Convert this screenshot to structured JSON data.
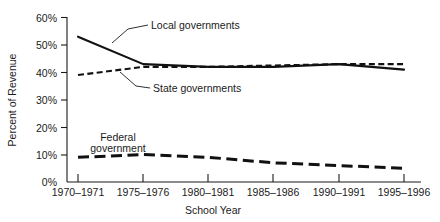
{
  "chart_data": {
    "type": "line",
    "title": "",
    "xlabel": "School Year",
    "ylabel": "Percent of Revenue",
    "categories": [
      "1970–1971",
      "1975–1976",
      "1980–1981",
      "1985–1986",
      "1990–1991",
      "1995–1996"
    ],
    "x": [
      1970,
      1975,
      1980,
      1985,
      1990,
      1995
    ],
    "ylim": [
      0,
      60
    ],
    "xlim": [
      1970,
      1995
    ],
    "ytick_labels": [
      "0%",
      "10%",
      "20%",
      "30%",
      "40%",
      "50%",
      "60%"
    ],
    "ytick_values": [
      0,
      10,
      20,
      30,
      40,
      50,
      60
    ],
    "grid": false,
    "legend_position": "inline-annotations",
    "series": [
      {
        "name": "Local governments",
        "style": "solid",
        "color": "#111111",
        "values": [
          53,
          43,
          42,
          42,
          43,
          41
        ]
      },
      {
        "name": "State governments",
        "style": "short-dashed",
        "color": "#111111",
        "values": [
          39,
          42,
          42,
          42.5,
          43,
          43
        ]
      },
      {
        "name": "Federal government",
        "style": "long-dashed",
        "color": "#111111",
        "values": [
          9,
          10,
          9,
          7,
          6,
          5
        ]
      }
    ],
    "annotations": [
      {
        "text": "Local governments",
        "series": "Local governments"
      },
      {
        "text": "State governments",
        "series": "State governments"
      },
      {
        "text": "Federal",
        "series": "Federal government"
      },
      {
        "text": "government",
        "series": "Federal government"
      }
    ]
  },
  "axes": {
    "y_title": "Percent of Revenue",
    "x_title": "School Year",
    "y_ticks": [
      {
        "label": "60%"
      },
      {
        "label": "50%"
      },
      {
        "label": "40%"
      },
      {
        "label": "30%"
      },
      {
        "label": "20%"
      },
      {
        "label": "10%"
      },
      {
        "label": "0%"
      }
    ],
    "x_ticks": [
      {
        "label": "1970–1971"
      },
      {
        "label": "1975–1976"
      },
      {
        "label": "1980–1981"
      },
      {
        "label": "1985–1986"
      },
      {
        "label": "1990–1991"
      },
      {
        "label": "1995–1996"
      }
    ]
  },
  "labels": {
    "local": "Local governments",
    "state": "State governments",
    "federal_line1": "Federal",
    "federal_line2": "government"
  }
}
